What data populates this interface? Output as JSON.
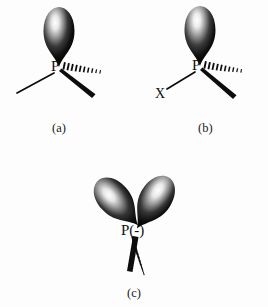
{
  "figure": {
    "background_color": "#fdfdfd",
    "ink_color": "#0d0d0d",
    "panels": [
      {
        "id": "a",
        "caption": "(a)",
        "center_atom": "P",
        "charge": "",
        "lobe_count": 1,
        "lobes": [
          {
            "name": "lone-pair-up",
            "direction": "up",
            "tilt_deg": 0
          }
        ],
        "bonds": [
          {
            "name": "plain-bond-left",
            "style": "plain",
            "direction": "down-left",
            "substituent": ""
          },
          {
            "name": "wedge-bond-right",
            "style": "wedge",
            "direction": "down-right",
            "substituent": ""
          },
          {
            "name": "hash-bond-right",
            "style": "hash",
            "direction": "right",
            "substituent": ""
          }
        ]
      },
      {
        "id": "b",
        "caption": "(b)",
        "center_atom": "P",
        "charge": "",
        "lobe_count": 1,
        "lobes": [
          {
            "name": "lone-pair-up",
            "direction": "up",
            "tilt_deg": 0
          }
        ],
        "bonds": [
          {
            "name": "plain-bond-left",
            "style": "plain",
            "direction": "down-left",
            "substituent": "X"
          },
          {
            "name": "wedge-bond-right",
            "style": "wedge",
            "direction": "down-right",
            "substituent": ""
          },
          {
            "name": "hash-bond-right",
            "style": "hash",
            "direction": "right",
            "substituent": ""
          }
        ]
      },
      {
        "id": "c",
        "caption": "(c)",
        "center_atom": "P",
        "charge": "(-)",
        "charge_full_label": "P(-)",
        "lobe_count": 2,
        "lobes": [
          {
            "name": "lone-pair-up-left",
            "direction": "up-left",
            "tilt_deg": -42
          },
          {
            "name": "lone-pair-up-right",
            "direction": "up-right",
            "tilt_deg": 32
          }
        ],
        "bonds": [
          {
            "name": "wedge-bond-down",
            "style": "wedge",
            "direction": "down-left",
            "substituent": ""
          },
          {
            "name": "hash-bond-down",
            "style": "hash",
            "direction": "down-right",
            "substituent": ""
          }
        ]
      }
    ],
    "substituent_labels": {
      "x_label": "X"
    }
  }
}
